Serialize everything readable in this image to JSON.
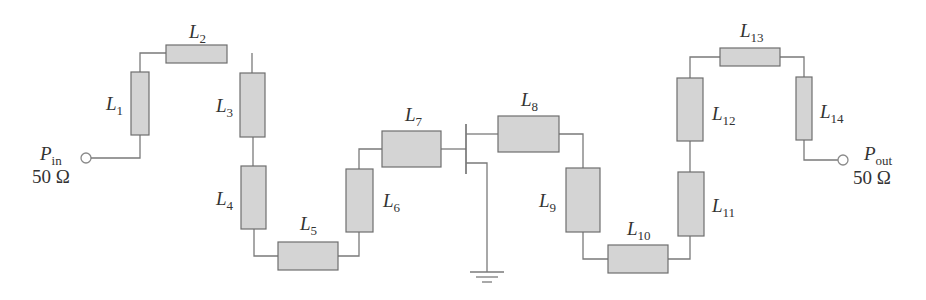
{
  "diagram": {
    "type": "microstrip matching network schematic",
    "input_port": {
      "symbol": "P",
      "subscript": "in",
      "impedance": "50 Ω"
    },
    "output_port": {
      "symbol": "P",
      "subscript": "out",
      "impedance": "50 Ω"
    },
    "elements": [
      {
        "id": "L1",
        "symbol": "L",
        "subscript": "1"
      },
      {
        "id": "L2",
        "symbol": "L",
        "subscript": "2"
      },
      {
        "id": "L3",
        "symbol": "L",
        "subscript": "3"
      },
      {
        "id": "L4",
        "symbol": "L",
        "subscript": "4"
      },
      {
        "id": "L5",
        "symbol": "L",
        "subscript": "5"
      },
      {
        "id": "L6",
        "symbol": "L",
        "subscript": "6"
      },
      {
        "id": "L7",
        "symbol": "L",
        "subscript": "7"
      },
      {
        "id": "L8",
        "symbol": "L",
        "subscript": "8"
      },
      {
        "id": "L9",
        "symbol": "L",
        "subscript": "9"
      },
      {
        "id": "L10",
        "symbol": "L",
        "subscript": "10"
      },
      {
        "id": "L11",
        "symbol": "L",
        "subscript": "11"
      },
      {
        "id": "L12",
        "symbol": "L",
        "subscript": "12"
      },
      {
        "id": "L13",
        "symbol": "L",
        "subscript": "13"
      },
      {
        "id": "L14",
        "symbol": "L",
        "subscript": "14"
      }
    ],
    "active_device": "transistor with grounded source",
    "colors": {
      "line_fill": "#d4d4d4",
      "line_stroke": "#6e6e6e",
      "wire": "#7a7a7a",
      "text": "#333333"
    }
  }
}
